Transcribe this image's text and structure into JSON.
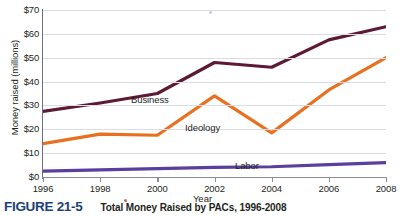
{
  "chart_data": {
    "type": "line",
    "title": "Total Money Raised by PACs, 1996-2008",
    "figure_number": "FIGURE 21-5",
    "xlabel": "Year",
    "ylabel": "Money raised (millions)",
    "categories": [
      "1996",
      "1998",
      "2000",
      "2002",
      "2004",
      "2006",
      "2008"
    ],
    "x": [
      1996,
      1998,
      2000,
      2002,
      2004,
      2006,
      2008
    ],
    "xlim": [
      1996,
      2008
    ],
    "ylim": [
      0,
      70
    ],
    "ytick_labels": [
      "$0",
      "$10",
      "$20",
      "$30",
      "$40",
      "$50",
      "$60",
      "$70"
    ],
    "ytick_values": [
      0,
      10,
      20,
      30,
      40,
      50,
      60,
      70
    ],
    "grid": true,
    "legend": "inline-labels",
    "series": [
      {
        "name": "Business",
        "color": "#5d1a34",
        "values": [
          27.5,
          31.0,
          35.0,
          48.0,
          46.0,
          57.5,
          63.0
        ]
      },
      {
        "name": "Ideology",
        "color": "#e8701f",
        "values": [
          14.0,
          18.0,
          17.5,
          34.0,
          18.5,
          36.5,
          50.0
        ]
      },
      {
        "name": "Labor",
        "color": "#5a3f9e",
        "values": [
          2.5,
          3.0,
          3.5,
          4.0,
          4.3,
          5.2,
          6.0
        ]
      }
    ]
  }
}
